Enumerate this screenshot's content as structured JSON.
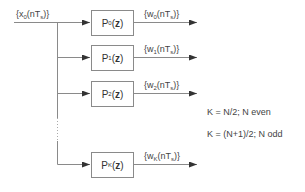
{
  "input": {
    "label_prefix": "{x",
    "label_sub": "0",
    "label_mid": "(nT",
    "label_sub2": "s",
    "label_suffix": ")}"
  },
  "filters": [
    {
      "name": "P",
      "sub": "0",
      "arg_open": "(",
      "arg": "z",
      "arg_close": ")",
      "out_prefix": "{w",
      "out_sub": "0",
      "out_mid": "(nT",
      "out_sub2": "s",
      "out_suffix": ")}"
    },
    {
      "name": "P",
      "sub": "1",
      "arg_open": "(",
      "arg": "z",
      "arg_close": ")",
      "out_prefix": "{w",
      "out_sub": "1",
      "out_mid": "(nT",
      "out_sub2": "s",
      "out_suffix": ")}"
    },
    {
      "name": "P",
      "sub": "2",
      "arg_open": "(",
      "arg": "z",
      "arg_close": ")",
      "out_prefix": "{w",
      "out_sub": "2",
      "out_mid": "(nT",
      "out_sub2": "s",
      "out_suffix": ")}"
    },
    {
      "name": "P",
      "sub": "K",
      "arg_open": "(",
      "arg": "z",
      "arg_close": ")",
      "out_prefix": "{w",
      "out_sub": "K",
      "out_mid": "(nT",
      "out_sub2": "s",
      "out_suffix": ")}"
    }
  ],
  "notes": [
    "K = N/2; N even",
    "K = (N+1)/2; N odd"
  ],
  "colors": {
    "line": "#8a8a8a",
    "text": "#444444"
  }
}
